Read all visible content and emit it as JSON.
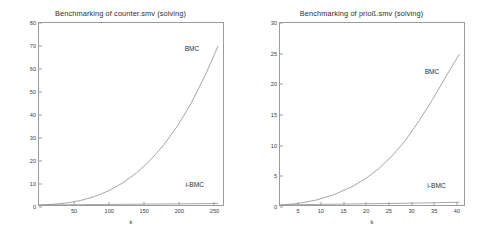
{
  "chart_data": [
    {
      "type": "line",
      "title": "Benchmarking of counter.smv  (solving)",
      "xlabel": "k",
      "ylabel": "benchmark measure [secs]",
      "xlim": [
        0,
        265
      ],
      "ylim": [
        0,
        80
      ],
      "xticks": [
        50,
        100,
        150,
        200,
        250
      ],
      "yticks": [
        0,
        10,
        20,
        30,
        40,
        50,
        60,
        70,
        80
      ],
      "grid": false,
      "legend_position": "inline-annotation",
      "series": [
        {
          "name": "BMC",
          "label_x": 218,
          "label_y": 69,
          "x": [
            0,
            20,
            40,
            60,
            80,
            100,
            120,
            140,
            160,
            180,
            200,
            220,
            240,
            258
          ],
          "values": [
            0.0,
            0.3,
            0.9,
            2.0,
            3.7,
            6.2,
            9.6,
            14.0,
            19.6,
            26.5,
            35.0,
            45.2,
            57.4,
            70.0
          ]
        },
        {
          "name": "i-BMC",
          "label_x": 222,
          "label_y": 10,
          "x": [
            0,
            40,
            80,
            120,
            160,
            200,
            240,
            258
          ],
          "values": [
            0.0,
            0.1,
            0.2,
            0.3,
            0.4,
            0.5,
            0.6,
            0.7
          ]
        }
      ]
    },
    {
      "type": "line",
      "title": "Benchmarking of prioß.smv (solving)",
      "xlabel": "k",
      "ylabel": "",
      "xlim": [
        1,
        42
      ],
      "ylim": [
        0,
        30
      ],
      "xticks": [
        5,
        10,
        15,
        20,
        25,
        30,
        35,
        40
      ],
      "yticks": [
        0,
        5,
        10,
        15,
        20,
        25,
        30
      ],
      "grid": false,
      "legend_position": "inline-annotation",
      "series": [
        {
          "name": "BMC",
          "label_x": 34.5,
          "label_y": 22.2,
          "x": [
            1,
            5,
            9,
            13,
            17,
            20,
            23,
            26,
            29,
            32,
            35,
            38,
            41
          ],
          "values": [
            0.0,
            0.25,
            0.8,
            1.7,
            3.0,
            4.3,
            6.0,
            8.1,
            10.7,
            13.9,
            17.4,
            21.2,
            24.9
          ]
        },
        {
          "name": "i-BMC",
          "label_x": 35.5,
          "label_y": 3.6,
          "x": [
            1,
            10,
            20,
            30,
            41
          ],
          "values": [
            0.0,
            0.1,
            0.2,
            0.3,
            0.45
          ]
        }
      ]
    }
  ]
}
